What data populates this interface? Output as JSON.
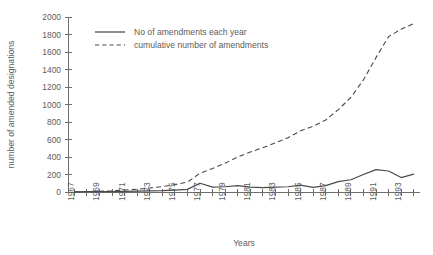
{
  "chart_data": {
    "type": "line",
    "title": "",
    "xlabel": "Years",
    "ylabel": "number of amended designations",
    "xlim": [
      1966.5,
      1994.5
    ],
    "ylim": [
      0,
      2000
    ],
    "grid": false,
    "legend_position": "upper-left-inside",
    "ytick_labels": [
      "0",
      "200",
      "400",
      "600",
      "800",
      "1000",
      "1200",
      "1400",
      "1600",
      "1800",
      "2000"
    ],
    "ytick_values": [
      0,
      200,
      400,
      600,
      800,
      1000,
      1200,
      1400,
      1600,
      1800,
      2000
    ],
    "xtick_labels": [
      "1967",
      "1969",
      "1971",
      "1973",
      "1975",
      "1977",
      "1979",
      "1981",
      "1983",
      "1985",
      "1987",
      "1989",
      "1991",
      "1993"
    ],
    "xtick_values": [
      1967,
      1969,
      1971,
      1973,
      1975,
      1977,
      1979,
      1981,
      1983,
      1985,
      1987,
      1989,
      1991,
      1993
    ],
    "x": [
      1967,
      1968,
      1969,
      1970,
      1971,
      1972,
      1973,
      1974,
      1975,
      1976,
      1977,
      1978,
      1979,
      1980,
      1981,
      1982,
      1983,
      1984,
      1985,
      1986,
      1987,
      1988,
      1989,
      1990,
      1991,
      1992,
      1993,
      1994
    ],
    "series": [
      {
        "name": "No of amendments each year",
        "style": "solid",
        "color": "#4a4a4a",
        "values": [
          2,
          3,
          4,
          5,
          8,
          10,
          14,
          16,
          22,
          30,
          100,
          55,
          60,
          72,
          55,
          50,
          55,
          60,
          78,
          52,
          72,
          118,
          140,
          200,
          255,
          240,
          165,
          205
        ]
      },
      {
        "name": "cumulative number of amendments",
        "style": "dashed",
        "color": "#4a4a4a",
        "values": [
          2,
          5,
          9,
          14,
          22,
          32,
          46,
          62,
          84,
          114,
          214,
          269,
          329,
          401,
          456,
          506,
          561,
          621,
          699,
          751,
          823,
          941,
          1081,
          1281,
          1536,
          1776,
          1860,
          1925
        ]
      }
    ]
  },
  "legend": {
    "entries": [
      {
        "label": "No of amendments each year",
        "style": "solid"
      },
      {
        "label": "cumulative number of amendments",
        "style": "dashed"
      }
    ]
  },
  "axes": {
    "y_title": "number of amended designations",
    "x_title": "Years"
  }
}
